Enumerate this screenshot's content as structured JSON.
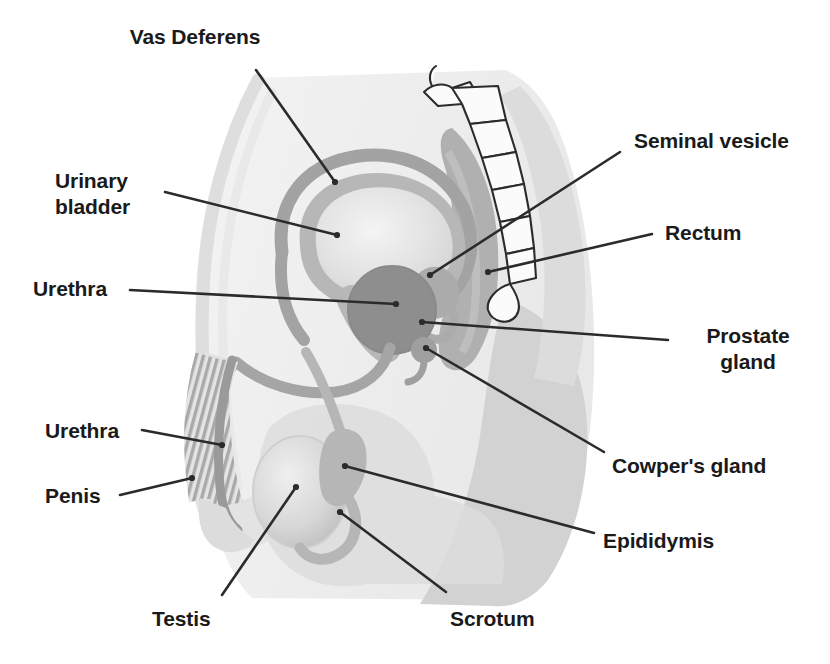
{
  "figure": {
    "background_color": "#ffffff",
    "label_color": "#1a1a1a",
    "leader_line_color": "#2b2b2b",
    "palette": {
      "body_outline": "#ededed",
      "body_fill": "#e8e8e8",
      "buttock_fill": "#d4d4d4",
      "pelvic_mid": "#cfcfcf",
      "duct_gray": "#a9a9a9",
      "organ_mid": "#b5b5b5",
      "prostate_dark": "#8e8e8e",
      "bladder_light": "#e2e2e2",
      "bone_outline": "#2b2b2b",
      "bone_fill": "#fbfbfb"
    }
  },
  "labels": [
    {
      "id": "vas-deferens",
      "text": "Vas Deferens",
      "align": "center",
      "x": 195,
      "y": 24,
      "leader": {
        "x1": 256,
        "y1": 70,
        "x2": 335,
        "y2": 182
      }
    },
    {
      "id": "urinary-bladder",
      "text": "Urinary\nbladder",
      "align": "left",
      "x": 55,
      "y": 168,
      "leader": {
        "x1": 165,
        "y1": 192,
        "x2": 337,
        "y2": 235
      }
    },
    {
      "id": "urethra-upper",
      "text": "Urethra",
      "align": "left",
      "x": 33,
      "y": 276,
      "leader": {
        "x1": 130,
        "y1": 290,
        "x2": 396,
        "y2": 304
      }
    },
    {
      "id": "urethra-lower",
      "text": "Urethra",
      "align": "left",
      "x": 45,
      "y": 418,
      "leader": {
        "x1": 142,
        "y1": 430,
        "x2": 222,
        "y2": 445
      }
    },
    {
      "id": "penis",
      "text": "Penis",
      "align": "left",
      "x": 45,
      "y": 483,
      "leader": {
        "x1": 120,
        "y1": 495,
        "x2": 192,
        "y2": 478
      }
    },
    {
      "id": "testis",
      "text": "Testis",
      "align": "left",
      "x": 152,
      "y": 606,
      "leader": {
        "x1": 222,
        "y1": 595,
        "x2": 296,
        "y2": 487
      }
    },
    {
      "id": "scrotum",
      "text": "Scrotum",
      "align": "left",
      "x": 450,
      "y": 606,
      "leader": {
        "x1": 446,
        "y1": 592,
        "x2": 340,
        "y2": 512
      }
    },
    {
      "id": "seminal-vesicle",
      "text": "Seminal vesicle",
      "align": "left",
      "x": 634,
      "y": 128,
      "leader": {
        "x1": 620,
        "y1": 152,
        "x2": 430,
        "y2": 275
      }
    },
    {
      "id": "rectum",
      "text": "Rectum",
      "align": "left",
      "x": 665,
      "y": 220,
      "leader": {
        "x1": 652,
        "y1": 234,
        "x2": 488,
        "y2": 272
      }
    },
    {
      "id": "prostate-gland",
      "text": "Prostate\ngland",
      "align": "center",
      "x": 675,
      "y": 323,
      "leader": {
        "x1": 668,
        "y1": 340,
        "x2": 422,
        "y2": 322
      }
    },
    {
      "id": "cowpers-gland",
      "text": "Cowper's gland",
      "align": "left",
      "x": 612,
      "y": 453,
      "leader": {
        "x1": 604,
        "y1": 452,
        "x2": 426,
        "y2": 348
      }
    },
    {
      "id": "epididymis",
      "text": "Epididymis",
      "align": "left",
      "x": 603,
      "y": 528,
      "leader": {
        "x1": 594,
        "y1": 533,
        "x2": 345,
        "y2": 466
      }
    }
  ]
}
